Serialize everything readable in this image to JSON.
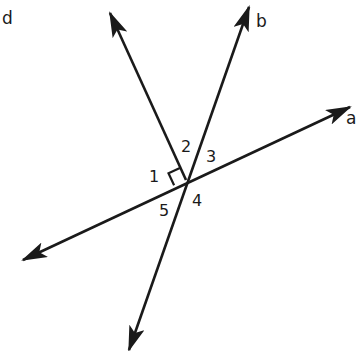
{
  "diagram": {
    "stroke_color": "#1a1a1a",
    "background": "#ffffff",
    "intersection": [
      186,
      180
    ],
    "lines": [
      {
        "id": "a-line",
        "from": [
          23,
          260
        ],
        "to": [
          350,
          107
        ],
        "arrow_start": true,
        "arrow_end": true
      },
      {
        "id": "b-line",
        "from": [
          129,
          350
        ],
        "to": [
          249,
          7
        ],
        "arrow_start": true,
        "arrow_end": true
      },
      {
        "id": "d-line",
        "from": [
          186,
          180
        ],
        "to": [
          110,
          13
        ],
        "arrow_start": false,
        "arrow_end": true
      }
    ],
    "ray_labels": [
      {
        "text": "d",
        "x": 8,
        "y": 24
      },
      {
        "text": "b",
        "x": 256,
        "y": 27
      },
      {
        "text": "a",
        "x": 347,
        "y": 124
      }
    ],
    "angle_labels": [
      {
        "text": "1",
        "x": 150,
        "y": 181
      },
      {
        "text": "2",
        "x": 181,
        "y": 151
      },
      {
        "text": "3",
        "x": 206,
        "y": 161
      },
      {
        "text": "4",
        "x": 192,
        "y": 206
      },
      {
        "text": "5",
        "x": 159,
        "y": 216
      }
    ],
    "right_angle_marker": {
      "between": [
        "d-line",
        "a-line"
      ],
      "angle": "1"
    }
  }
}
